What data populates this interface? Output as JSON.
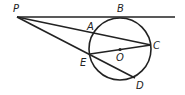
{
  "diagram": {
    "type": "geometry",
    "labels": {
      "P": "P",
      "A": "A",
      "B": "B",
      "C": "C",
      "E": "E",
      "O": "O",
      "D": "D"
    },
    "stroke_color": "#222222"
  }
}
